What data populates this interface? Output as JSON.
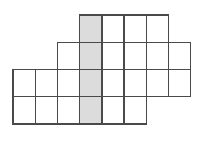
{
  "figure": {
    "name": "polyomino-grid-figure",
    "background_color": "#ffffff",
    "grid_line_color": "#4a4a4a",
    "grid_line_width": 1.4,
    "shaded_fill_color": "#dcdcdc",
    "cell_fill_color": "#ffffff",
    "geometry": {
      "cell_width": 22.2,
      "cell_height": 27.2,
      "origin_x": 13,
      "origin_y": 15,
      "columns": 8,
      "rows": 4,
      "column_x": [
        13,
        35.2,
        57.4,
        79.6,
        101.8,
        124,
        146.2,
        168.4,
        190.6
      ],
      "row_y": [
        15,
        42.2,
        69.4,
        96.6,
        123.8
      ]
    },
    "shaded_column_index": 3,
    "total_cells": 24,
    "rows_data": [
      {
        "row_index": 0,
        "first_col": 3,
        "last_col": 6,
        "cell_count": 4
      },
      {
        "row_index": 1,
        "first_col": 2,
        "last_col": 7,
        "cell_count": 6
      },
      {
        "row_index": 2,
        "first_col": 0,
        "last_col": 7,
        "cell_count": 8
      },
      {
        "row_index": 3,
        "first_col": 0,
        "last_col": 5,
        "cell_count": 6
      }
    ]
  }
}
